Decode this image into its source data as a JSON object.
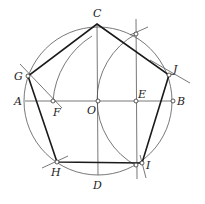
{
  "diagram": {
    "type": "geometric-construction",
    "labels": {
      "C": "C",
      "G": "G",
      "J": "J",
      "A": "A",
      "F": "F",
      "O": "O",
      "E": "E",
      "B": "B",
      "H": "H",
      "I": "I",
      "D": "D"
    },
    "points": {
      "O": [
        98,
        101
      ],
      "A": [
        25,
        101
      ],
      "B": [
        173,
        101
      ],
      "C": [
        97,
        24
      ],
      "D": [
        98,
        175
      ],
      "E": [
        136,
        101
      ],
      "F": [
        53,
        101
      ],
      "G": [
        28,
        76
      ],
      "J": [
        169,
        75
      ],
      "H": [
        57,
        162
      ],
      "I": [
        142,
        163
      ],
      "T": [
        136,
        34
      ]
    },
    "colors": {
      "ink": "#1a1a1a",
      "construction": "#555555",
      "background": "#ffffff"
    }
  }
}
